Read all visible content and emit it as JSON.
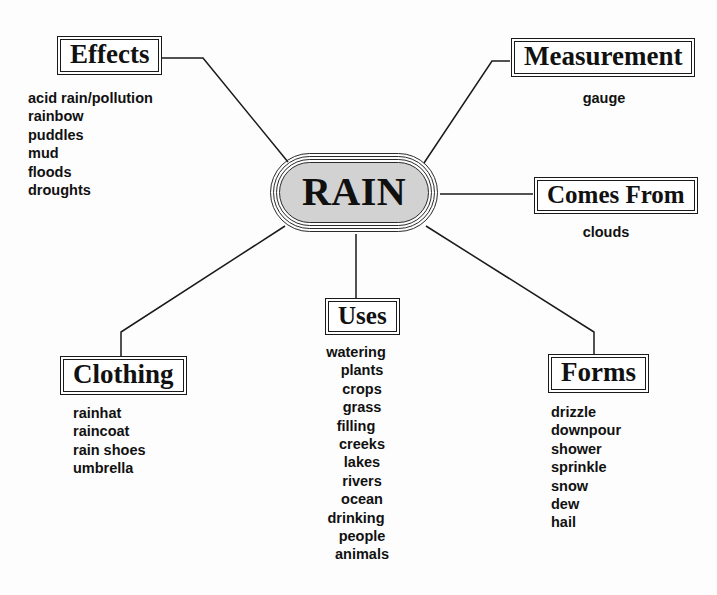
{
  "diagram": {
    "title": "RAIN",
    "center": {
      "label": "RAIN",
      "fill_color": "#d2d2d2",
      "stroke_color": "#2b2b2b"
    },
    "line_color": "#1a1a1a",
    "branches": [
      {
        "id": "effects",
        "label": "Effects",
        "items": [
          "acid rain/pollution",
          "rainbow",
          "puddles",
          "mud",
          "floods",
          "droughts"
        ]
      },
      {
        "id": "measurement",
        "label": "Measurement",
        "items": [
          "gauge"
        ]
      },
      {
        "id": "comes-from",
        "label": "Comes From",
        "items": [
          "clouds"
        ]
      },
      {
        "id": "clothing",
        "label": "Clothing",
        "items": [
          "rainhat",
          "raincoat",
          "rain shoes",
          "umbrella"
        ]
      },
      {
        "id": "uses",
        "label": "Uses",
        "items": [
          "watering",
          "plants",
          "crops",
          "grass",
          "filling",
          "creeks",
          "lakes",
          "rivers",
          "ocean",
          "drinking",
          "people",
          "animals"
        ]
      },
      {
        "id": "forms",
        "label": "Forms",
        "items": [
          "drizzle",
          "downpour",
          "shower",
          "sprinkle",
          "snow",
          "dew",
          "hail"
        ]
      }
    ]
  }
}
